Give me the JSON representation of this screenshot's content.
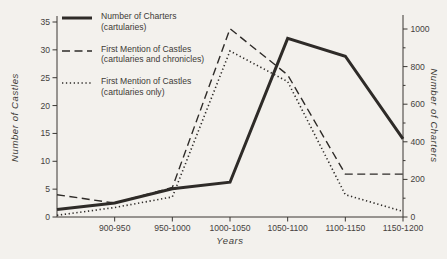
{
  "chart_data": {
    "type": "line",
    "title": "",
    "xlabel": "Years",
    "ylabel_left": "Number of Castles",
    "ylabel_right": "Number of Charters",
    "grid": false,
    "legend_position": "top-left",
    "categories": [
      "",
      "900-950",
      "950-1000",
      "1000-1050",
      "1050-1100",
      "1100-1150",
      "1150-1200"
    ],
    "left_axis": {
      "min": 0,
      "max": 35,
      "ticks": [
        0,
        5,
        10,
        15,
        20,
        25,
        30,
        35
      ]
    },
    "right_axis": {
      "min": 0,
      "max": 1000,
      "ticks": [
        0,
        200,
        400,
        600,
        800,
        1000
      ],
      "minor_step": 100
    },
    "series": [
      {
        "name": "number-of-charters-cartularies",
        "label_line1": "Number of Charters",
        "label_line2": "(cartularies)",
        "style": "solid",
        "axis": "right",
        "values": [
          40,
          75,
          150,
          185,
          950,
          855,
          415
        ]
      },
      {
        "name": "first-mention-castles-cartularies-and-chronicles",
        "label_line1": "First Mention of Castles",
        "label_line2": "(cartularies and chronicles)",
        "style": "dashed",
        "axis": "left",
        "values": [
          4,
          2.5,
          5.3,
          33.8,
          25.5,
          7.7,
          7.7
        ]
      },
      {
        "name": "first-mention-castles-cartularies-only",
        "label_line1": "First Mention of Castles",
        "label_line2": "(cartularies only)",
        "style": "dotted",
        "axis": "left",
        "values": [
          0.3,
          1.7,
          3.6,
          29.8,
          24.3,
          4,
          1
        ]
      }
    ],
    "line_color": "#2e2b28",
    "background": "#f3f1ed"
  }
}
